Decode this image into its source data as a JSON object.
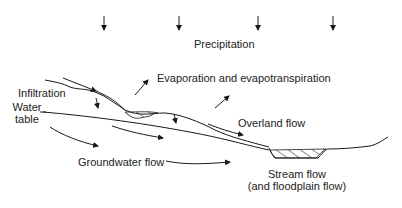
{
  "diagram": {
    "type": "hydrologic-cycle-cross-section",
    "labels": {
      "precipitation": "Precipitation",
      "evaporation": "Evaporation and evapotranspiration",
      "infiltration": "Infiltration",
      "water_table_line1": "Water",
      "water_table_line2": "table",
      "overland_flow": "Overland flow",
      "groundwater_flow": "Groundwater flow",
      "stream_flow_line1": "Stream flow",
      "stream_flow_line2": "(and floodplain flow)"
    },
    "precipitation_arrow_count": 4,
    "colors": {
      "line": "#1a1a1a",
      "background": "#ffffff"
    }
  }
}
